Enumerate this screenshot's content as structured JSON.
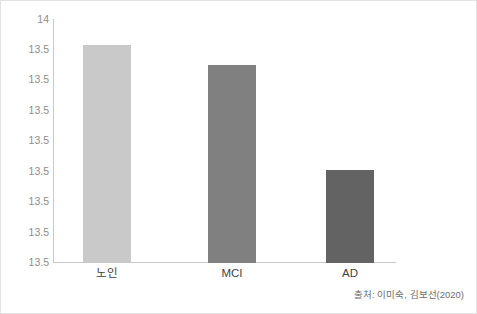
{
  "chart_data": {
    "type": "bar",
    "title": "",
    "subtitle": "",
    "xlabel": "",
    "ylabel": "",
    "categories": [
      "노인",
      "MCI",
      "AD"
    ],
    "values": [
      13.6,
      13.55,
      13.5
    ],
    "series": [
      {
        "name": "",
        "values": [
          13.6,
          13.55,
          13.5
        ]
      }
    ],
    "bar_colors": [
      "#c9c9c9",
      "#808080",
      "#636363"
    ],
    "ylim": [
      13.5,
      14
    ],
    "y_tick_labels": [
      "14",
      "13.5",
      "13.5",
      "13.5",
      "13.5",
      "13.5",
      "13.5",
      "13.5",
      "13.5"
    ],
    "y_tick_positions": [
      18,
      48,
      78,
      109,
      139,
      170,
      200,
      231,
      261
    ],
    "grid": false,
    "legend": false,
    "legend_position": "none",
    "annotations": [
      "출처: 이미숙, 김보선(2020)"
    ]
  },
  "axes": {
    "y_ticks": [
      {
        "label": "14",
        "y": 18
      },
      {
        "label": "13.5",
        "y": 48
      },
      {
        "label": "13.5",
        "y": 78
      },
      {
        "label": "13.5",
        "y": 109
      },
      {
        "label": "13.5",
        "y": 139
      },
      {
        "label": "13.5",
        "y": 170
      },
      {
        "label": "13.5",
        "y": 200
      },
      {
        "label": "13.5",
        "y": 231
      },
      {
        "label": "13.5",
        "y": 261
      }
    ]
  },
  "bars": [
    {
      "label": "노인",
      "color": "#c9c9c9",
      "left": 30,
      "width": 48,
      "top_px": 43,
      "center": 54
    },
    {
      "label": "MCI",
      "color": "#808080",
      "left": 155,
      "width": 48,
      "top_px": 63,
      "center": 179
    },
    {
      "label": "AD",
      "color": "#636363",
      "left": 273,
      "width": 48,
      "top_px": 168,
      "center": 297
    }
  ],
  "footer": {
    "source": "출처: 이미숙, 김보선(2020)"
  },
  "colors": {
    "axis": "#c9c9c9",
    "tick_text": "#8d8d8d",
    "category_text": "#3f3f3f",
    "source_text": "#6d6d6d",
    "border": "#e2e2e2",
    "background": "#ffffff"
  }
}
